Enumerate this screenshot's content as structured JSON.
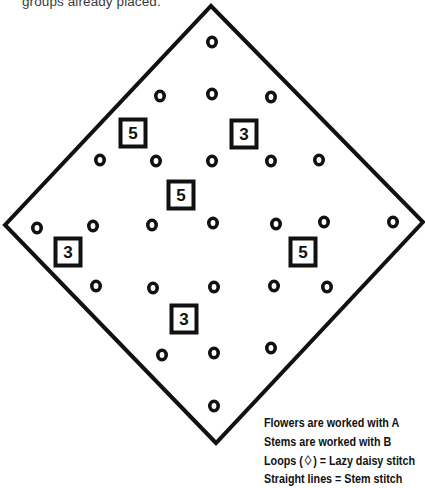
{
  "intro_text": "groups already placed.",
  "diagram": {
    "outline": {
      "top": [
        211,
        6
      ],
      "right": [
        423,
        222
      ],
      "bottom": [
        216,
        443
      ],
      "left": [
        5,
        225
      ],
      "stroke": "#111111"
    },
    "flower_marker_label": "o",
    "flowers": [
      [
        212,
        42
      ],
      [
        160,
        96
      ],
      [
        212,
        94
      ],
      [
        271,
        97
      ],
      [
        100,
        160
      ],
      [
        156,
        161
      ],
      [
        212,
        161
      ],
      [
        271,
        161
      ],
      [
        319,
        160
      ],
      [
        37,
        228
      ],
      [
        93,
        226
      ],
      [
        152,
        225
      ],
      [
        213,
        223
      ],
      [
        276,
        224
      ],
      [
        324,
        222
      ],
      [
        393,
        222
      ],
      [
        96,
        286
      ],
      [
        153,
        288
      ],
      [
        214,
        287
      ],
      [
        274,
        286
      ],
      [
        327,
        287
      ],
      [
        162,
        355
      ],
      [
        214,
        353
      ],
      [
        271,
        348
      ],
      [
        214,
        406
      ]
    ],
    "groups": [
      {
        "label": "5",
        "x": 133,
        "y": 133
      },
      {
        "label": "3",
        "x": 244,
        "y": 134
      },
      {
        "label": "5",
        "x": 181,
        "y": 195
      },
      {
        "label": "3",
        "x": 68,
        "y": 252
      },
      {
        "label": "5",
        "x": 303,
        "y": 252
      },
      {
        "label": "3",
        "x": 184,
        "y": 319
      }
    ]
  },
  "legend": {
    "line1": "Flowers are worked with A",
    "line2": "Stems are worked with B",
    "line3": "Loops (0̂) = Lazy daisy stitch",
    "line3_text": "Loops (♢) = Lazy daisy stitch",
    "line4": "Straight lines = Stem stitch"
  }
}
